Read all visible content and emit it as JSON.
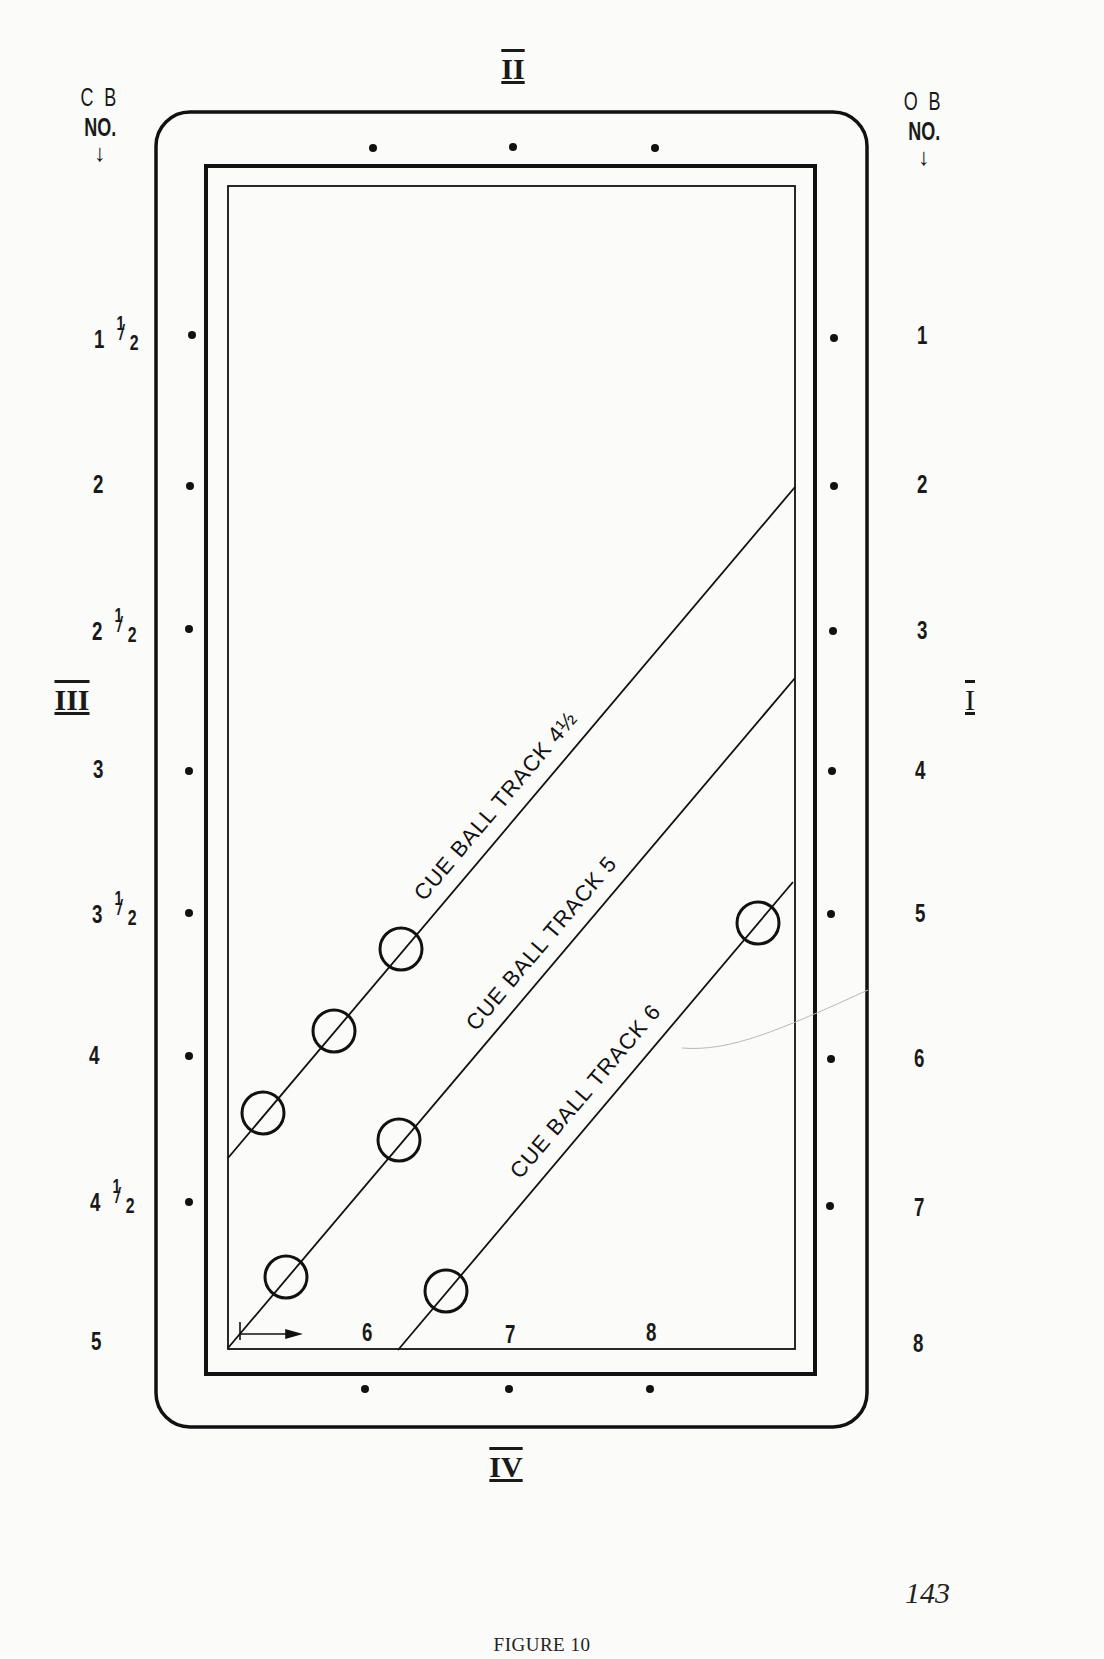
{
  "figure": {
    "caption": "FIGURE 10",
    "page_number": "143"
  },
  "headers": {
    "left": {
      "line1": "C B",
      "line2": "NO.",
      "arrow": "↓"
    },
    "right": {
      "line1": "O B",
      "line2": "NO.",
      "arrow": "↓"
    }
  },
  "rails": {
    "top": "II",
    "right": "I",
    "bottom": "IV",
    "left": "III"
  },
  "cue_ball_numbers": [
    {
      "whole": "1",
      "num": "1",
      "den": "2",
      "y": 338
    },
    {
      "whole": "2",
      "num": "",
      "den": "",
      "y": 486
    },
    {
      "whole": "2",
      "num": "1",
      "den": "2",
      "y": 630
    },
    {
      "whole": "3",
      "num": "",
      "den": "",
      "y": 771
    },
    {
      "whole": "3",
      "num": "1",
      "den": "2",
      "y": 913
    },
    {
      "whole": "4",
      "num": "",
      "den": "",
      "y": 1056
    },
    {
      "whole": "4",
      "num": "1",
      "den": "2",
      "y": 1200
    },
    {
      "whole": "5",
      "num": "",
      "den": "",
      "y": 1343
    }
  ],
  "object_ball_numbers": [
    "1",
    "2",
    "3",
    "4",
    "5",
    "6",
    "7",
    "8"
  ],
  "bottom_rail_numbers": [
    "6",
    "7",
    "8"
  ],
  "tracks": [
    {
      "label": "CUE BALL TRACK 4½",
      "x1": 228,
      "y1": 1158,
      "x2": 795,
      "y2": 487
    },
    {
      "label": "CUE BALL TRACK 5",
      "x1": 228,
      "y1": 1348,
      "x2": 795,
      "y2": 678
    },
    {
      "label": "CUE BALL TRACK 6",
      "x1": 398,
      "y1": 1350,
      "x2": 793,
      "y2": 882
    }
  ],
  "balls": [
    {
      "track": "4½",
      "cx": 401,
      "cy": 949
    },
    {
      "track": "4½",
      "cx": 334,
      "cy": 1031
    },
    {
      "track": "4½",
      "cx": 263,
      "cy": 1113
    },
    {
      "track": "5",
      "cx": 399,
      "cy": 1140
    },
    {
      "track": "5",
      "cx": 286,
      "cy": 1277
    },
    {
      "track": "6",
      "cx": 758,
      "cy": 923
    },
    {
      "track": "6",
      "cx": 446,
      "cy": 1291
    }
  ]
}
